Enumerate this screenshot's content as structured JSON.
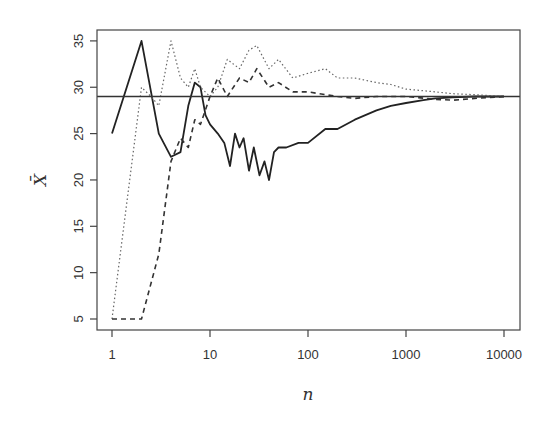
{
  "chart_data": {
    "type": "line",
    "title": "",
    "xlabel": "n",
    "ylabel": "X̄",
    "x_scale": "log",
    "xlim": [
      1,
      10000
    ],
    "ylim": [
      4,
      36
    ],
    "x_ticks": [
      1,
      10,
      100,
      1000,
      10000
    ],
    "x_tick_labels": [
      "1",
      "10",
      "100",
      "1000",
      "10000"
    ],
    "y_ticks": [
      5,
      10,
      15,
      20,
      25,
      30,
      35
    ],
    "y_tick_labels": [
      "5",
      "10",
      "15",
      "20",
      "25",
      "30",
      "35"
    ],
    "grid": false,
    "legend": null,
    "reference_line": {
      "y": 29,
      "style": "solid"
    },
    "series": [
      {
        "name": "run-solid",
        "style": "solid",
        "x": [
          1,
          2,
          3,
          4,
          5,
          6,
          7,
          8,
          9,
          10,
          12,
          14,
          16,
          18,
          20,
          22,
          25,
          28,
          32,
          36,
          40,
          45,
          50,
          60,
          80,
          100,
          150,
          200,
          300,
          500,
          700,
          1000,
          1500,
          2000,
          3000,
          5000,
          10000
        ],
        "values": [
          25,
          35,
          25,
          22.5,
          23,
          28,
          30.5,
          30,
          27,
          26,
          25,
          24,
          21.5,
          25,
          23.5,
          24.5,
          21,
          23.5,
          20.5,
          22,
          20,
          23,
          23.5,
          23.5,
          24,
          24,
          25.5,
          25.5,
          26.5,
          27.5,
          28,
          28.3,
          28.6,
          28.8,
          28.9,
          29,
          29
        ]
      },
      {
        "name": "run-dotted",
        "style": "dotted",
        "x": [
          1,
          2,
          2.5,
          3,
          4,
          5,
          6,
          7,
          8,
          10,
          12,
          15,
          20,
          25,
          30,
          40,
          50,
          70,
          100,
          150,
          200,
          300,
          500,
          700,
          1000,
          2000,
          3000,
          5000,
          10000
        ],
        "values": [
          5,
          30,
          29,
          28,
          35,
          31,
          30,
          32,
          30,
          29,
          30,
          33,
          32,
          34,
          34.5,
          32,
          33,
          31,
          31.5,
          32,
          31,
          31,
          30.5,
          30.3,
          29.8,
          29.5,
          29.3,
          29.2,
          29
        ]
      },
      {
        "name": "run-dashed",
        "style": "dashed",
        "x": [
          1,
          2,
          3,
          4,
          5,
          6,
          7,
          8,
          10,
          12,
          15,
          20,
          25,
          30,
          40,
          50,
          70,
          100,
          200,
          300,
          500,
          1000,
          2000,
          3000,
          5000,
          10000
        ],
        "values": [
          5,
          5,
          12,
          22,
          24.5,
          23.5,
          26.5,
          26,
          29,
          31,
          29,
          31,
          30.5,
          32,
          30,
          30.5,
          29.5,
          29.5,
          29,
          28.8,
          29,
          29,
          28.7,
          28.6,
          28.8,
          29
        ]
      }
    ]
  }
}
